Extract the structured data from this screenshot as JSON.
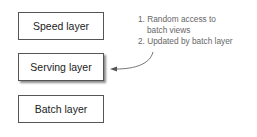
{
  "boxes": [
    {
      "label": "Speed layer"
    },
    {
      "label": "Serving layer"
    },
    {
      "label": "Batch layer"
    }
  ],
  "annotation": {
    "lines": [
      "1. Random access to",
      "    batch views",
      "2. Updated by batch layer"
    ]
  }
}
